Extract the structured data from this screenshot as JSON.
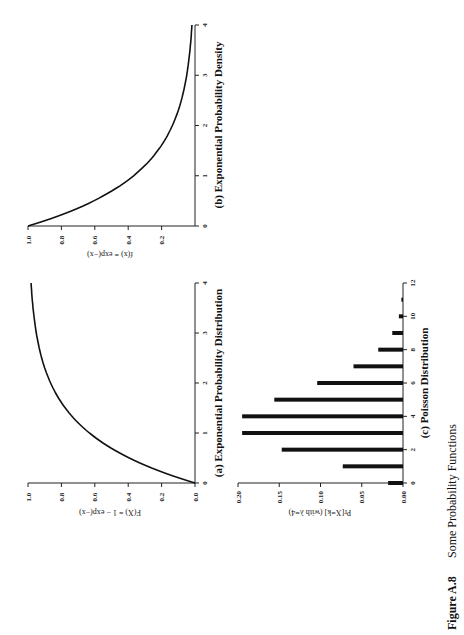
{
  "figure": {
    "caption_label": "Figure A.8",
    "caption_text": "Some Probability Functions",
    "orientation": "rotated 90° counter-clockwise"
  },
  "colors": {
    "ink": "#111111",
    "background": "#ffffff"
  },
  "chart_data": [
    {
      "id": "a",
      "type": "line",
      "title": "(a) Exponential Probability Distribution",
      "xlabel": "",
      "ylabel": "F(X) = 1 − exp(−x)",
      "xlim": [
        0,
        4
      ],
      "ylim": [
        0.0,
        1.0
      ],
      "x_ticks": [
        "0",
        "1",
        "2",
        "3",
        "4"
      ],
      "y_ticks": [
        "0.0",
        "0.2",
        "0.4",
        "0.6",
        "0.8",
        "1.0"
      ],
      "x": [
        0,
        0.5,
        1,
        1.5,
        2,
        2.5,
        3,
        3.5,
        4
      ],
      "y": [
        0.0,
        0.39,
        0.63,
        0.78,
        0.86,
        0.92,
        0.95,
        0.97,
        0.98
      ],
      "grid": false
    },
    {
      "id": "b",
      "type": "line",
      "title": "(b) Exponential Probability Density",
      "xlabel": "",
      "ylabel": "f(x) = exp(−x)",
      "xlim": [
        0,
        4
      ],
      "ylim": [
        0.0,
        1.0
      ],
      "x_ticks": [
        "0",
        "1",
        "2",
        "3",
        "4"
      ],
      "y_ticks": [
        "0.2",
        "0.4",
        "0.6",
        "0.8",
        "1.0"
      ],
      "x": [
        0,
        0.5,
        1,
        1.5,
        2,
        2.5,
        3,
        3.5,
        4
      ],
      "y": [
        1.0,
        0.61,
        0.37,
        0.22,
        0.14,
        0.08,
        0.05,
        0.03,
        0.02
      ],
      "grid": false
    },
    {
      "id": "c",
      "type": "bar",
      "title": "(c) Poisson Distribution",
      "xlabel": "",
      "ylabel": "Pr[X=k] (with λ=4)",
      "xlim": [
        0,
        12
      ],
      "ylim": [
        0.0,
        0.2
      ],
      "x_ticks": [
        "0",
        "2",
        "4",
        "6",
        "8",
        "10",
        "12"
      ],
      "y_ticks": [
        "0.00",
        "0.05",
        "0.10",
        "0.15",
        "0.20"
      ],
      "categories": [
        0,
        1,
        2,
        3,
        4,
        5,
        6,
        7,
        8,
        9,
        10,
        11
      ],
      "values": [
        0.018,
        0.073,
        0.147,
        0.195,
        0.195,
        0.156,
        0.104,
        0.06,
        0.03,
        0.013,
        0.005,
        0.002
      ],
      "grid": false
    }
  ]
}
